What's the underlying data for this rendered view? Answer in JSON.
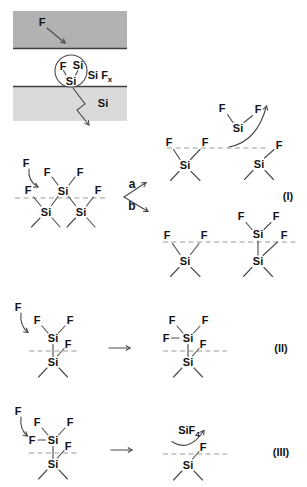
{
  "colors": {
    "background": "#ffffff",
    "plasma_band": "#b2b2b2",
    "substrate_band": "#dadada",
    "band_edge": "#3f3f3f",
    "bond": "#4a4a4a",
    "dashed_line": "#9b9b9b",
    "text": "#141414"
  },
  "schematic": {
    "incoming_atom": "F",
    "circle_f": "F",
    "circle_si_top": "Si",
    "circle_si_bottom": "Si",
    "species_base": "Si F",
    "species_sub": "x",
    "substrate_label": "Si"
  },
  "reaction_I": {
    "equation_label": "(I)",
    "branch_a": "a",
    "branch_b": "b",
    "reactant": {
      "incoming_f": "F",
      "f_top_left": "F",
      "f_top_right": "F",
      "si_center": "Si",
      "f_surface_left": "F",
      "f_surface_right": "F",
      "si_lattice_left": "Si",
      "si_lattice_right": "Si"
    },
    "product_a": {
      "f_left": "F",
      "f_right": "F",
      "si_desorbing": "Si",
      "f_surface_1": "F",
      "f_surface_2": "F",
      "f_surface_right": "F",
      "si_lattice_left": "Si",
      "si_lattice_right": "Si"
    },
    "product_b": {
      "f_top_left": "F",
      "f_top_right": "F",
      "si_top": "Si",
      "f_surface_right": "F",
      "f_surface_1": "F",
      "f_surface_2": "F",
      "si_lattice_left": "Si",
      "si_lattice_right": "Si"
    }
  },
  "reaction_II": {
    "equation_label": "(II)",
    "reactant": {
      "incoming_f": "F",
      "f_top_left": "F",
      "f_top_right": "F",
      "si_top": "Si",
      "f_surface": "F",
      "si_lattice": "Si"
    },
    "product": {
      "f_left": "F",
      "f_top_left": "F",
      "f_top_right": "F",
      "si_top": "Si",
      "f_surface": "F",
      "si_lattice": "Si"
    }
  },
  "reaction_III": {
    "equation_label": "(III)",
    "reactant": {
      "incoming_f": "F",
      "f_top_left": "F",
      "f_top_right": "F",
      "f_left": "F",
      "si_top": "Si",
      "f_surface": "F",
      "si_lattice": "Si"
    },
    "product": {
      "desorbing_base": "SiF",
      "desorbing_sub": "4",
      "f_surface": "F",
      "si_lattice": "Si"
    }
  }
}
